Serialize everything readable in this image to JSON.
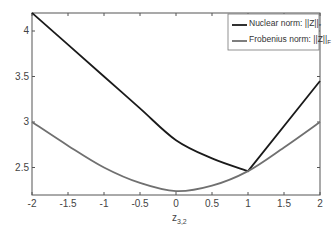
{
  "chart_data": {
    "type": "line",
    "title": "",
    "xlabel": "z_{3,2}",
    "ylabel": "",
    "xlim": [
      -2,
      2
    ],
    "ylim": [
      2.2,
      4.2
    ],
    "grid": false,
    "legend_position": "upper right",
    "x": [
      -2,
      -1.5,
      -1,
      -0.5,
      0,
      0.5,
      1,
      1.5,
      2
    ],
    "series": [
      {
        "name": "Nuclear norm: ||Z||*",
        "color": "#1a1a1a",
        "values": [
          4.2,
          3.85,
          3.5,
          3.15,
          2.8,
          2.6,
          2.46,
          2.95,
          3.45
        ]
      },
      {
        "name": "Frobenius norm: ||Z||F",
        "color": "#707070",
        "values": [
          3.0,
          2.74,
          2.5,
          2.33,
          2.24,
          2.3,
          2.46,
          2.72,
          3.0
        ]
      }
    ],
    "xticks": [
      "-2",
      "-1.5",
      "-1",
      "-0.5",
      "0",
      "0.5",
      "1",
      "1.5",
      "2"
    ],
    "yticks": [
      "2.5",
      "3",
      "3.5",
      "4"
    ]
  },
  "legend": {
    "nuclear": "Nuclear norm: ||Z||",
    "nuclear_sub": "*",
    "frobenius": "Frobenius norm: ||Z||",
    "frobenius_sub": "F"
  },
  "axis": {
    "xlabel_main": "z",
    "xlabel_sub": "3,2"
  }
}
